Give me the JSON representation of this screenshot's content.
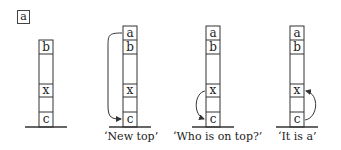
{
  "panel_label": "a",
  "stacks": [
    {
      "cells": [
        "b",
        "",
        "x",
        "",
        "c"
      ],
      "caption": "",
      "arrow": "none"
    },
    {
      "cells": [
        "a",
        "b",
        "",
        "x",
        "",
        "c"
      ],
      "caption": "‘New top’",
      "arrow": "a-to-c"
    },
    {
      "cells": [
        "a",
        "b",
        "",
        "x",
        "",
        "c"
      ],
      "caption": "‘Who is on top?’",
      "arrow": "x-to-c"
    },
    {
      "cells": [
        "a",
        "b",
        "",
        "x",
        "",
        "c"
      ],
      "caption": "‘It is a’",
      "arrow": "c-to-x"
    }
  ]
}
